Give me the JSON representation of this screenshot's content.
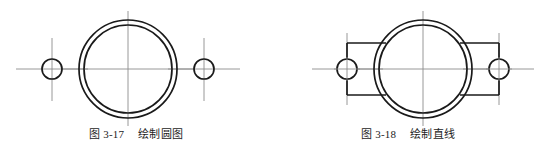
{
  "page": {
    "background_color": "#ffffff",
    "line_color": "#1a1a1a",
    "centerline_color": "#8c8c8c",
    "text_color": "#1c1c1c"
  },
  "figures": [
    {
      "id": "fig-3-17",
      "caption_label": "图 3-17",
      "caption_title": "绘制圆图",
      "drawing": {
        "type": "cad-2d-part-outline",
        "main_circles": {
          "center": {
            "x": 128,
            "y": 69
          },
          "outer_radius": 49,
          "inner_radius": 44
        },
        "bolt_holes": [
          {
            "name": "left-bolt-hole",
            "center": {
              "x": 52,
              "y": 69
            },
            "radius": 10
          },
          {
            "name": "right-bolt-hole",
            "center": {
              "x": 204,
              "y": 69
            },
            "radius": 10
          }
        ],
        "centerlines": [
          {
            "name": "main-horizontal-centerline",
            "x1": 62,
            "y1": 69,
            "x2": 194,
            "y2": 69
          },
          {
            "name": "main-vertical-centerline",
            "x1": 128,
            "y1": 12,
            "x2": 128,
            "y2": 126
          },
          {
            "name": "left-hole-horizontal-centerline",
            "x1": 16,
            "y1": 69,
            "x2": 88,
            "y2": 69
          },
          {
            "name": "left-hole-vertical-centerline",
            "x1": 52,
            "y1": 38,
            "x2": 52,
            "y2": 101
          },
          {
            "name": "right-hole-horizontal-centerline",
            "x1": 168,
            "y1": 69,
            "x2": 240,
            "y2": 69
          },
          {
            "name": "right-hole-vertical-centerline",
            "x1": 204,
            "y1": 38,
            "x2": 204,
            "y2": 101
          }
        ],
        "tangent_lines": []
      }
    },
    {
      "id": "fig-3-18",
      "caption_label": "图 3-18",
      "caption_title": "绘制直线",
      "drawing": {
        "type": "cad-2d-part-outline",
        "main_circles": {
          "center": {
            "x": 151,
            "y": 69
          },
          "outer_radius": 49,
          "inner_radius": 44
        },
        "bolt_holes": [
          {
            "name": "left-bolt-hole",
            "center": {
              "x": 75,
              "y": 69
            },
            "radius": 10
          },
          {
            "name": "right-bolt-hole",
            "center": {
              "x": 227,
              "y": 69
            },
            "radius": 10
          }
        ],
        "centerlines": [
          {
            "name": "main-horizontal-centerline",
            "x1": 85,
            "y1": 69,
            "x2": 217,
            "y2": 69
          },
          {
            "name": "main-vertical-centerline",
            "x1": 151,
            "y1": 12,
            "x2": 151,
            "y2": 126
          },
          {
            "name": "left-hole-horizontal-centerline",
            "x1": 40,
            "y1": 69,
            "x2": 111,
            "y2": 69
          },
          {
            "name": "left-hole-vertical-centerline",
            "x1": 75,
            "y1": 33,
            "x2": 75,
            "y2": 105
          },
          {
            "name": "right-hole-horizontal-centerline",
            "x1": 191,
            "y1": 69,
            "x2": 262,
            "y2": 69
          },
          {
            "name": "right-hole-vertical-centerline",
            "x1": 227,
            "y1": 33,
            "x2": 227,
            "y2": 105
          }
        ],
        "tangent_lines": [
          {
            "name": "left-upper-tangent",
            "x1": 75,
            "y1": 43,
            "x2": 114,
            "y2": 43
          },
          {
            "name": "left-lower-tangent",
            "x1": 75,
            "y1": 95,
            "x2": 114,
            "y2": 95
          },
          {
            "name": "right-upper-tangent",
            "x1": 188,
            "y1": 43,
            "x2": 227,
            "y2": 43
          },
          {
            "name": "right-lower-tangent",
            "x1": 188,
            "y1": 95,
            "x2": 227,
            "y2": 95
          },
          {
            "name": "left-end-cap",
            "x1": 75,
            "y1": 43,
            "x2": 75,
            "y2": 95
          },
          {
            "name": "right-end-cap",
            "x1": 227,
            "y1": 43,
            "x2": 227,
            "y2": 95
          }
        ]
      }
    }
  ]
}
